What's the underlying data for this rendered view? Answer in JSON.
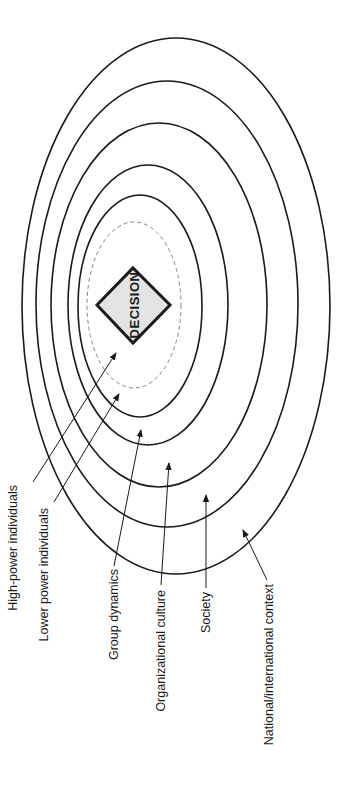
{
  "diagram": {
    "center_label": "DECISION",
    "layers": [
      {
        "name": "High-power individuals"
      },
      {
        "name": "Lower power individuals"
      },
      {
        "name": "Group dynamics"
      },
      {
        "name": "Organizational culture"
      },
      {
        "name": "Society"
      },
      {
        "name": "National/international context"
      }
    ],
    "colors": {
      "stroke": "#1a1a1a",
      "diamond_fill": "#e3e3e3",
      "dashed_ring": "#777777",
      "background": "#ffffff"
    }
  }
}
